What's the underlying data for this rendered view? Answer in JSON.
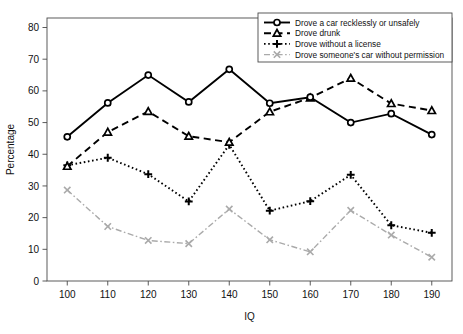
{
  "chart_data": {
    "type": "line",
    "title": "",
    "xlabel": "IQ",
    "ylabel": "Percentage",
    "x": [
      100,
      110,
      120,
      130,
      140,
      150,
      160,
      170,
      180,
      190
    ],
    "xlim": [
      95,
      195
    ],
    "ylim": [
      0,
      83
    ],
    "xticks": [
      "100",
      "110",
      "120",
      "130",
      "140",
      "150",
      "160",
      "170",
      "180",
      "190"
    ],
    "yticks": [
      "0",
      "10",
      "20",
      "30",
      "40",
      "50",
      "60",
      "70",
      "80"
    ],
    "grid": false,
    "legend_position": "top-right",
    "series": [
      {
        "name": "Drove a car recklessly or unsafely",
        "marker": "circle",
        "dash": "solid",
        "color": "#000000",
        "values": [
          45.5,
          56.2,
          65.0,
          56.5,
          66.8,
          56.1,
          58.0,
          50.0,
          52.8,
          46.2
        ]
      },
      {
        "name": "Drove drunk",
        "marker": "triangle",
        "dash": "dashed",
        "color": "#000000",
        "values": [
          36.2,
          47.0,
          53.5,
          45.7,
          43.8,
          53.4,
          57.8,
          64.0,
          56.0,
          53.8
        ]
      },
      {
        "name": "Drove without a license",
        "marker": "plus",
        "dash": "dotted",
        "color": "#000000",
        "values": [
          36.5,
          38.9,
          33.7,
          25.1,
          43.0,
          22.2,
          25.2,
          33.5,
          17.6,
          15.2
        ]
      },
      {
        "name": "Drove someone's car without permission",
        "marker": "cross",
        "dash": "dashdot",
        "color": "#aaaaaa",
        "values": [
          28.7,
          17.2,
          12.8,
          11.8,
          22.7,
          13.0,
          9.2,
          22.3,
          14.5,
          7.5
        ]
      }
    ]
  },
  "legend": {
    "items": [
      "Drove a car recklessly or unsafely",
      "Drove drunk",
      "Drove without a license",
      "Drove someone's car without permission"
    ]
  },
  "axes": {
    "x_title": "IQ",
    "y_title": "Percentage"
  }
}
